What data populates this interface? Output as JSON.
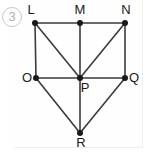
{
  "item": {
    "number": "3",
    "marker_shape": "circle"
  },
  "figure": {
    "type": "graph-diagram",
    "stroke_color": "#3b3b3b",
    "vertex_color": "#1a1a1a",
    "background_color": "#fefefe",
    "vertices": [
      {
        "id": "L",
        "label": "L",
        "x": 35,
        "y": 23,
        "label_x": 31,
        "label_y": 14,
        "label_anchor": "middle"
      },
      {
        "id": "M",
        "label": "M",
        "x": 80,
        "y": 23,
        "label_x": 80,
        "label_y": 14,
        "label_anchor": "middle"
      },
      {
        "id": "N",
        "label": "N",
        "x": 125,
        "y": 23,
        "label_x": 126,
        "label_y": 14,
        "label_anchor": "middle"
      },
      {
        "id": "O",
        "label": "O",
        "x": 36,
        "y": 78,
        "label_x": 27,
        "label_y": 82,
        "label_anchor": "middle"
      },
      {
        "id": "P",
        "label": "P",
        "x": 80,
        "y": 78,
        "label_x": 85,
        "label_y": 92,
        "label_anchor": "middle"
      },
      {
        "id": "Q",
        "label": "Q",
        "x": 125,
        "y": 78,
        "label_x": 134,
        "label_y": 82,
        "label_anchor": "middle"
      },
      {
        "id": "R",
        "label": "R",
        "x": 80,
        "y": 133,
        "label_x": 81,
        "label_y": 147,
        "label_anchor": "middle"
      }
    ],
    "edges": [
      {
        "from": "L",
        "to": "M"
      },
      {
        "from": "M",
        "to": "N"
      },
      {
        "from": "L",
        "to": "O"
      },
      {
        "from": "L",
        "to": "P"
      },
      {
        "from": "M",
        "to": "P"
      },
      {
        "from": "N",
        "to": "P"
      },
      {
        "from": "N",
        "to": "Q"
      },
      {
        "from": "O",
        "to": "P"
      },
      {
        "from": "P",
        "to": "Q"
      },
      {
        "from": "O",
        "to": "R"
      },
      {
        "from": "P",
        "to": "R"
      },
      {
        "from": "Q",
        "to": "R"
      }
    ]
  }
}
